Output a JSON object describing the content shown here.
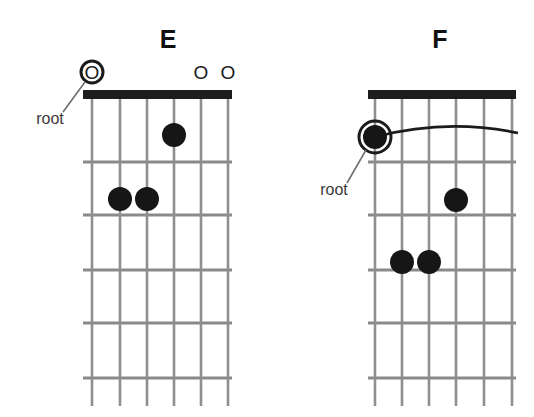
{
  "page": {
    "background_color": "#ffffff",
    "ink_color": "#161616",
    "line_color": "#8f8f8f",
    "width": 534,
    "height": 417
  },
  "diagrams": [
    {
      "id": "chord-e",
      "name": "E",
      "title": "E",
      "title_x": 168,
      "title_y": 48,
      "board": {
        "left": 83,
        "right": 232,
        "top": 90,
        "bottom": 406,
        "nut_height": 9,
        "string_count": 6,
        "fret_count": 5,
        "string_x": [
          92,
          120,
          147,
          174,
          201,
          228
        ],
        "fret_y": [
          162,
          215,
          270,
          323,
          378
        ]
      },
      "open_markers": [
        {
          "label": "O",
          "string": 2,
          "x": 201,
          "y": 79
        },
        {
          "label": "O",
          "string": 1,
          "x": 228,
          "y": 79
        }
      ],
      "root_marker": {
        "type": "open-circled",
        "label": "O",
        "x": 92,
        "y": 72,
        "ring_radius": 11
      },
      "dots": [
        {
          "string": 3,
          "fret": 1,
          "x": 174,
          "y": 135,
          "r": 12
        },
        {
          "string": 5,
          "fret": 2,
          "x": 120,
          "y": 199,
          "r": 12
        },
        {
          "string": 4,
          "fret": 2,
          "x": 147,
          "y": 199,
          "r": 12
        }
      ],
      "barre": null,
      "root_label": {
        "text": "root",
        "x": 50,
        "y": 124,
        "leader_from_x": 63,
        "leader_from_y": 112,
        "leader_to_x": 85,
        "leader_to_y": 82
      }
    },
    {
      "id": "chord-f",
      "name": "F",
      "title": "F",
      "title_x": 440,
      "title_y": 48,
      "board": {
        "left": 368,
        "right": 516,
        "top": 90,
        "bottom": 406,
        "nut_height": 9,
        "string_count": 6,
        "fret_count": 5,
        "string_x": [
          375,
          402,
          429,
          456,
          484,
          512
        ],
        "fret_y": [
          162,
          215,
          270,
          323,
          378
        ]
      },
      "open_markers": [],
      "root_marker": {
        "type": "dot-circled",
        "label": "",
        "x": 375,
        "y": 137,
        "ring_radius": 16
      },
      "dots": [
        {
          "string": 6,
          "fret": 1,
          "x": 375,
          "y": 137,
          "r": 12
        },
        {
          "string": 3,
          "fret": 2,
          "x": 456,
          "y": 200,
          "r": 12
        },
        {
          "string": 5,
          "fret": 3,
          "x": 402,
          "y": 262,
          "r": 12
        },
        {
          "string": 4,
          "fret": 3,
          "x": 429,
          "y": 262,
          "r": 12
        }
      ],
      "barre": {
        "fret": 1,
        "from_string": 6,
        "to_string": 1,
        "path": "M 375 137 Q 446 118 518 133"
      },
      "root_label": {
        "text": "root",
        "x": 334,
        "y": 195,
        "leader_from_x": 347,
        "leader_from_y": 183,
        "leader_to_x": 366,
        "leader_to_y": 150
      }
    }
  ]
}
